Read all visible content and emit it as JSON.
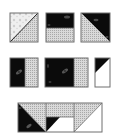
{
  "diagram": {
    "type": "quilt-piecing-steps",
    "colors": {
      "dark": "#0b0b0b",
      "dotted": "#d6d6d6",
      "dot": "#9a9a9a",
      "light_print": "#ececec",
      "white": "#ffffff",
      "outline": "#6f6f6f",
      "motif": "#5a5a5a"
    },
    "rows": [
      {
        "name": "row-1",
        "blocks": [
          {
            "name": "half-square-triangle-light-print-dotted"
          },
          {
            "name": "two-strip-dark-over-dotted"
          },
          {
            "name": "half-square-triangle-dark-dotted"
          }
        ]
      },
      {
        "name": "row-2",
        "blocks": [
          {
            "name": "two-strip-dark-left-dotted-right"
          },
          {
            "name": "wide-dark-with-dotted-strip"
          },
          {
            "name": "narrow-dark-corner-white"
          }
        ]
      },
      {
        "name": "row-3",
        "blocks": [
          {
            "name": "assembled-unit"
          }
        ]
      }
    ]
  }
}
